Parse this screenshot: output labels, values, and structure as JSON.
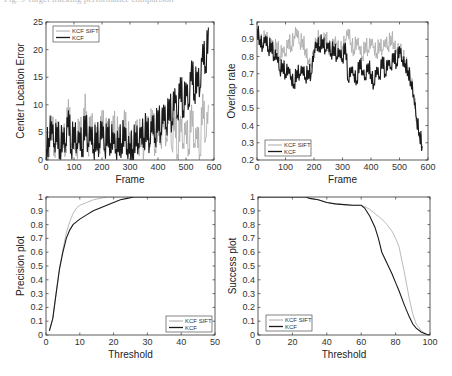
{
  "caption": "Fig. 9  Target tracking performance comparison",
  "colors": {
    "kcf_sift": "#a8a8a8",
    "kcf": "#1a1a1a",
    "axis": "#333333"
  },
  "chart_data": [
    {
      "id": "cle",
      "type": "line",
      "title": "",
      "xlabel": "Frame",
      "ylabel": "Center Location Error",
      "xlim": [
        0,
        600
      ],
      "ylim": [
        0,
        25
      ],
      "xticks": [
        0,
        100,
        200,
        300,
        400,
        500,
        600
      ],
      "yticks": [
        0,
        5,
        10,
        15,
        20,
        25
      ],
      "grid": false,
      "legend_position": "upper-left",
      "box": [
        46,
        22,
        214,
        160
      ],
      "x": [
        0,
        10,
        20,
        30,
        40,
        50,
        60,
        70,
        80,
        90,
        100,
        110,
        120,
        130,
        140,
        150,
        160,
        170,
        180,
        190,
        200,
        210,
        220,
        230,
        240,
        250,
        260,
        270,
        280,
        290,
        300,
        310,
        320,
        330,
        340,
        350,
        360,
        370,
        380,
        390,
        400,
        410,
        420,
        430,
        440,
        450,
        460,
        470,
        480,
        490,
        500,
        510,
        520,
        530,
        540,
        550,
        560,
        570,
        580
      ],
      "series": [
        {
          "name": "KCF SIFT",
          "values": [
            3,
            1,
            8,
            2,
            7,
            1,
            6,
            2,
            11,
            3,
            5,
            2,
            7,
            3,
            12,
            2,
            8,
            3,
            6,
            2,
            9,
            3,
            7,
            2,
            8,
            4,
            6,
            2,
            9,
            3,
            5,
            1,
            7,
            3,
            6,
            2,
            8,
            4,
            9,
            2,
            7,
            3,
            10,
            4,
            11,
            2,
            9,
            1,
            8,
            3,
            7,
            2,
            10,
            3,
            6,
            1,
            12,
            4,
            10
          ]
        },
        {
          "name": "KCF",
          "values": [
            2,
            4,
            7,
            3,
            6,
            2,
            5,
            3,
            9,
            2,
            6,
            3,
            5,
            2,
            8,
            3,
            6,
            2,
            5,
            3,
            7,
            2,
            6,
            3,
            5,
            2,
            4,
            3,
            6,
            2,
            3,
            2,
            5,
            3,
            6,
            4,
            7,
            3,
            8,
            4,
            9,
            5,
            10,
            6,
            11,
            7,
            13,
            8,
            15,
            9,
            14,
            10,
            18,
            12,
            16,
            13,
            21,
            17,
            24
          ]
        }
      ]
    },
    {
      "id": "overlap",
      "type": "line",
      "title": "",
      "xlabel": "Frame",
      "ylabel": "Overlap rate",
      "xlim": [
        0,
        600
      ],
      "ylim": [
        0.2,
        1
      ],
      "xticks": [
        0,
        100,
        200,
        300,
        400,
        500,
        600
      ],
      "yticks": [
        0.2,
        0.3,
        0.4,
        0.5,
        0.6,
        0.7,
        0.8,
        0.9,
        1
      ],
      "grid": false,
      "legend_position": "lower-left",
      "box": [
        257,
        22,
        428,
        160
      ],
      "x": [
        0,
        10,
        20,
        30,
        40,
        50,
        60,
        70,
        80,
        90,
        100,
        110,
        120,
        130,
        140,
        150,
        160,
        170,
        180,
        190,
        200,
        210,
        220,
        230,
        240,
        250,
        260,
        270,
        280,
        290,
        300,
        310,
        320,
        330,
        340,
        350,
        360,
        370,
        380,
        390,
        400,
        410,
        420,
        430,
        440,
        450,
        460,
        470,
        480,
        490,
        500,
        510,
        520,
        530,
        540,
        550,
        560,
        570,
        580
      ],
      "series": [
        {
          "name": "KCF SIFT",
          "values": [
            0.97,
            0.92,
            0.88,
            0.93,
            0.86,
            0.9,
            0.84,
            0.88,
            0.8,
            0.85,
            0.82,
            0.9,
            0.86,
            0.92,
            0.96,
            0.88,
            0.9,
            0.84,
            0.78,
            0.76,
            0.82,
            0.9,
            0.92,
            0.88,
            0.93,
            0.86,
            0.84,
            0.9,
            0.88,
            0.82,
            0.86,
            0.9,
            0.96,
            0.88,
            0.84,
            0.9,
            0.86,
            0.8,
            0.88,
            0.84,
            0.9,
            0.86,
            0.82,
            0.88,
            0.84,
            0.9,
            0.86,
            0.92,
            0.88,
            0.84,
            0.86,
            0.8,
            0.78,
            0.74,
            0.68,
            0.58,
            0.44,
            0.36,
            0.29
          ]
        },
        {
          "name": "KCF",
          "values": [
            0.96,
            0.9,
            0.86,
            0.92,
            0.84,
            0.88,
            0.8,
            0.82,
            0.72,
            0.76,
            0.7,
            0.74,
            0.68,
            0.64,
            0.72,
            0.7,
            0.74,
            0.68,
            0.72,
            0.7,
            0.84,
            0.88,
            0.86,
            0.9,
            0.84,
            0.88,
            0.82,
            0.86,
            0.8,
            0.84,
            0.78,
            0.88,
            0.66,
            0.74,
            0.7,
            0.66,
            0.78,
            0.72,
            0.68,
            0.76,
            0.7,
            0.64,
            0.74,
            0.68,
            0.8,
            0.7,
            0.78,
            0.74,
            0.82,
            0.76,
            0.86,
            0.78,
            0.76,
            0.72,
            0.66,
            0.58,
            0.44,
            0.36,
            0.28
          ]
        }
      ]
    },
    {
      "id": "precision",
      "type": "line",
      "title": "",
      "xlabel": "Threshold",
      "ylabel": "Precision plot",
      "xlim": [
        0,
        50
      ],
      "ylim": [
        0,
        1
      ],
      "xticks": [
        0,
        10,
        20,
        30,
        40,
        50
      ],
      "yticks": [
        0,
        0.1,
        0.2,
        0.3,
        0.4,
        0.5,
        0.6,
        0.7,
        0.8,
        0.9,
        1
      ],
      "grid": false,
      "legend_position": "lower-right",
      "box": [
        46,
        197,
        215,
        335
      ],
      "x": [
        1,
        2,
        3,
        4,
        5,
        6,
        7,
        8,
        9,
        10,
        12,
        14,
        16,
        18,
        20,
        22,
        24,
        26,
        30,
        40,
        50
      ],
      "series": [
        {
          "name": "KCF SIFT",
          "values": [
            0.03,
            0.12,
            0.3,
            0.48,
            0.62,
            0.74,
            0.82,
            0.88,
            0.92,
            0.94,
            0.96,
            0.98,
            0.99,
            1,
            1,
            1,
            1,
            1,
            1,
            1,
            1
          ]
        },
        {
          "name": "KCF",
          "values": [
            0.03,
            0.12,
            0.3,
            0.48,
            0.6,
            0.7,
            0.76,
            0.8,
            0.82,
            0.84,
            0.87,
            0.9,
            0.92,
            0.94,
            0.96,
            0.98,
            0.99,
            1,
            1,
            1,
            1
          ]
        }
      ]
    },
    {
      "id": "success",
      "type": "line",
      "title": "",
      "xlabel": "Threshold",
      "ylabel": "Success plot",
      "xlim": [
        0,
        100
      ],
      "ylim": [
        0,
        1
      ],
      "xticks": [
        0,
        20,
        40,
        60,
        80,
        100
      ],
      "yticks": [
        0,
        0.1,
        0.2,
        0.3,
        0.4,
        0.5,
        0.6,
        0.7,
        0.8,
        0.9,
        1
      ],
      "grid": false,
      "legend_position": "lower-left",
      "box": [
        258,
        197,
        430,
        335
      ],
      "x": [
        0,
        10,
        20,
        28,
        30,
        35,
        40,
        45,
        50,
        55,
        60,
        62,
        65,
        68,
        70,
        72,
        75,
        78,
        80,
        82,
        85,
        88,
        90,
        92,
        95,
        98,
        100
      ],
      "series": [
        {
          "name": "KCF SIFT",
          "values": [
            1,
            1,
            1,
            1,
            0.99,
            0.98,
            0.96,
            0.95,
            0.945,
            0.94,
            0.94,
            0.93,
            0.91,
            0.88,
            0.86,
            0.84,
            0.8,
            0.75,
            0.7,
            0.64,
            0.46,
            0.26,
            0.15,
            0.08,
            0.03,
            0.005,
            0
          ]
        },
        {
          "name": "KCF",
          "values": [
            1,
            1,
            1,
            1,
            0.99,
            0.98,
            0.96,
            0.95,
            0.945,
            0.94,
            0.94,
            0.92,
            0.86,
            0.78,
            0.7,
            0.6,
            0.52,
            0.44,
            0.38,
            0.32,
            0.22,
            0.13,
            0.08,
            0.05,
            0.02,
            0.005,
            0
          ]
        }
      ]
    }
  ]
}
